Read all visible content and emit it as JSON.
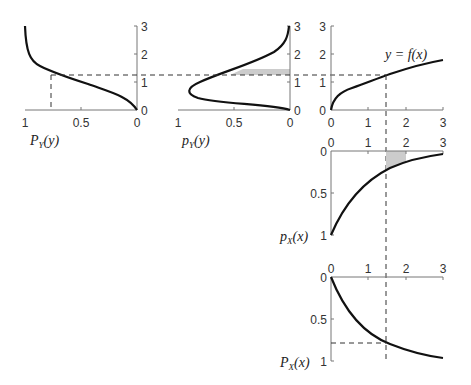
{
  "panels": {
    "cdf_y": {
      "label_main": "P",
      "label_sub": "Y",
      "label_arg": "(y)",
      "x_ticks": [
        "1",
        "0.5",
        "0"
      ],
      "y_ticks": [
        "0",
        "1",
        "2",
        "3"
      ]
    },
    "pdf_y": {
      "label_main": "p",
      "label_sub": "Y",
      "label_arg": "(y)",
      "x_ticks": [
        "1",
        "0.5",
        "0"
      ],
      "y_ticks": [
        "0",
        "1",
        "2",
        "3"
      ]
    },
    "transform": {
      "label": "y = f(x)",
      "x_ticks": [
        "0",
        "1",
        "2",
        "3"
      ],
      "y_ticks": [
        "0",
        "1",
        "2",
        "3"
      ]
    },
    "pdf_x": {
      "label_main": "p",
      "label_sub": "X",
      "label_arg": "(x)",
      "x_ticks": [
        "0",
        "1",
        "2",
        "3"
      ],
      "y_ticks": [
        "0",
        "0.5",
        "1"
      ]
    },
    "cdf_x": {
      "label_main": "P",
      "label_sub": "X",
      "label_arg": "(x)",
      "x_ticks": [
        "0",
        "1",
        "2",
        "3"
      ],
      "y_ticks": [
        "0",
        "0.5",
        "1"
      ]
    }
  },
  "annotations": {
    "x_marker": 1.5,
    "y_marker": 1.22,
    "cdf_value": 0.78
  },
  "colors": {
    "curve": "#111111",
    "axis": "#777777",
    "shade": "#cccccc"
  }
}
